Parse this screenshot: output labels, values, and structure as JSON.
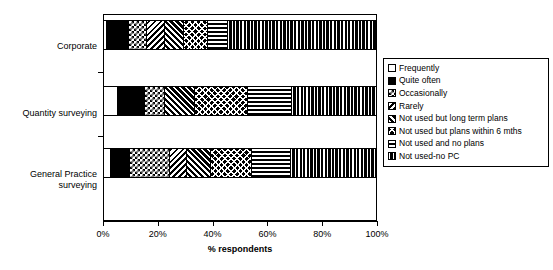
{
  "chart_data": {
    "type": "bar",
    "orientation": "horizontal",
    "stacked": true,
    "title": "",
    "xlabel": "% respondents",
    "ylabel": "",
    "xlim": [
      0,
      100
    ],
    "xticks": [
      "0%",
      "20%",
      "40%",
      "60%",
      "80%",
      "100%"
    ],
    "xtick_values": [
      0,
      20,
      40,
      60,
      80,
      100
    ],
    "grid": false,
    "legend_position": "right",
    "categories": [
      "Corporate",
      "Quantity surveying",
      "General Practice surveying"
    ],
    "series": [
      {
        "name": "Frequently",
        "pattern": "white",
        "values": [
          1.5,
          5.5,
          3.0
        ]
      },
      {
        "name": "Quite often",
        "pattern": "solid-black",
        "values": [
          8.0,
          10.0,
          7.0
        ]
      },
      {
        "name": "Occasionally",
        "pattern": "checkerboard",
        "values": [
          6.5,
          7.0,
          14.5
        ]
      },
      {
        "name": "Rarely",
        "pattern": "diagonal-stripes",
        "values": [
          6.5,
          0.0,
          6.0
        ]
      },
      {
        "name": "Not used but long term plans",
        "pattern": "chevron",
        "values": [
          7.0,
          11.0,
          9.0
        ]
      },
      {
        "name": "Not used but plans within 6 mths",
        "pattern": "cross-hatch",
        "values": [
          9.0,
          19.5,
          15.0
        ]
      },
      {
        "name": "Not used and no plans",
        "pattern": "horizontal-lines",
        "values": [
          7.0,
          16.0,
          14.0
        ]
      },
      {
        "name": "Not used-no PC",
        "pattern": "vertical-lines",
        "values": [
          54.5,
          31.0,
          31.5
        ]
      }
    ]
  },
  "axis": {
    "x_title": "% respondents",
    "ticks": [
      {
        "label": "0%",
        "value": 0
      },
      {
        "label": "20%",
        "value": 20
      },
      {
        "label": "40%",
        "value": 40
      },
      {
        "label": "60%",
        "value": 60
      },
      {
        "label": "80%",
        "value": 80
      },
      {
        "label": "100%",
        "value": 100
      }
    ]
  },
  "categories": [
    {
      "label": "Corporate"
    },
    {
      "label": "Quantity surveying"
    },
    {
      "label": "General Practice surveying"
    }
  ],
  "legend": {
    "items": [
      {
        "label": "Frequently",
        "swatch": "swatch-white"
      },
      {
        "label": "Quite often",
        "swatch": "swatch-solid-black"
      },
      {
        "label": "Occasionally",
        "swatch": "swatch-checkerboard"
      },
      {
        "label": "Rarely",
        "swatch": "swatch-diagonal-stripes"
      },
      {
        "label": "Not used but long term plans",
        "swatch": "swatch-chevron"
      },
      {
        "label": "Not used but plans within 6 mths",
        "swatch": "swatch-cross-hatch"
      },
      {
        "label": "Not used and no plans",
        "swatch": "swatch-horizontal-lines"
      },
      {
        "label": "Not used-no PC",
        "swatch": "swatch-vertical-lines"
      }
    ]
  },
  "colors": {
    "ink": "#000000",
    "paper": "#ffffff"
  }
}
